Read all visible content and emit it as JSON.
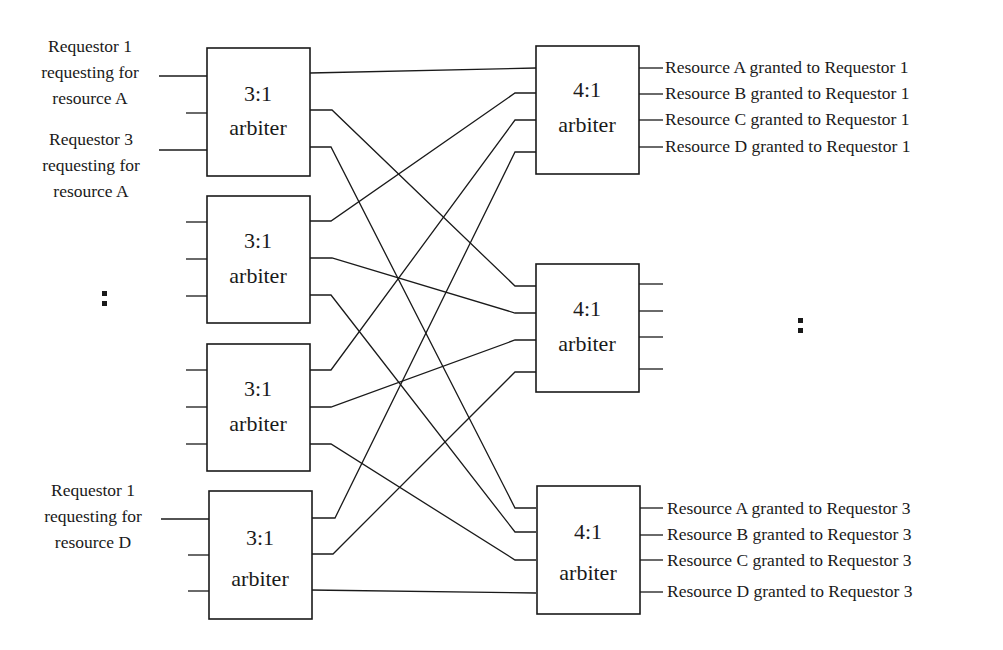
{
  "diagram": {
    "title": "",
    "arbiters_3to1": [
      {
        "ratio": "3:1",
        "name": "arbiter"
      },
      {
        "ratio": "3:1",
        "name": "arbiter"
      },
      {
        "ratio": "3:1",
        "name": "arbiter"
      },
      {
        "ratio": "3:1",
        "name": "arbiter"
      }
    ],
    "arbiters_4to1": [
      {
        "ratio": "4:1",
        "name": "arbiter"
      },
      {
        "ratio": "4:1",
        "name": "arbiter"
      },
      {
        "ratio": "4:1",
        "name": "arbiter"
      }
    ],
    "inputs": [
      {
        "lines": [
          "Requestor 1",
          "requesting for",
          "resource A"
        ]
      },
      {
        "lines": [
          "Requestor 3",
          "requesting for",
          "resource A"
        ]
      },
      {
        "lines": [
          "Requestor 1",
          "requesting for",
          "resource D"
        ]
      }
    ],
    "outputs_top": [
      "Resource A granted to Requestor 1",
      "Resource B granted to Requestor 1",
      "Resource C granted to Requestor 1",
      "Resource D granted to Requestor 1"
    ],
    "outputs_bottom": [
      "Resource A granted to Requestor 3",
      "Resource B granted to Requestor 3",
      "Resource C granted to Requestor 3",
      "Resource D granted to Requestor 3"
    ],
    "ellipsis_left": ":",
    "ellipsis_right": ":"
  }
}
